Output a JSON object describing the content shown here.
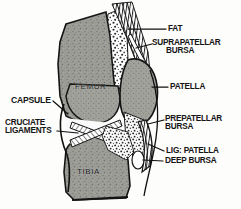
{
  "figure": {
    "background_color": "#fdfdfb",
    "ink_color": "#141414",
    "bone_fill_color": "#9a9a96",
    "stipple_fill_color": "#ffffff"
  },
  "internal_labels": {
    "femur": "FEMUR",
    "tibia": "TIBIA"
  },
  "callouts": {
    "fat": "FAT",
    "suprapatellar_bursa_line1": "SUPRAPATELLAR",
    "suprapatellar_bursa_line2": "BURSA",
    "patella": "PATELLA",
    "prepatellar_bursa_line1": "PREPATELLAR",
    "prepatellar_bursa_line2": "BURSA",
    "lig_patella": "LIG: PATELLA",
    "deep_bursa": "DEEP BURSA",
    "capsule": "CAPSULE",
    "cruciate_ligaments_line1": "CRUCIATE",
    "cruciate_ligaments_line2": "LIGAMENTS"
  },
  "structures": [
    {
      "name": "femur",
      "side": "internal",
      "texture": "stippled-grey"
    },
    {
      "name": "tibia",
      "side": "internal",
      "texture": "stippled-grey"
    },
    {
      "name": "patella",
      "side": "right",
      "texture": "stippled-grey"
    },
    {
      "name": "quadriceps-tendon",
      "side": "top",
      "texture": "parallel-lines"
    },
    {
      "name": "fat-pad",
      "side": "right",
      "texture": "coarse-stipple"
    },
    {
      "name": "suprapatellar-bursa",
      "side": "top-right",
      "texture": "line"
    },
    {
      "name": "prepatellar-bursa",
      "side": "right",
      "texture": "coarse-stipple"
    },
    {
      "name": "ligamentum-patellae",
      "side": "right-lower",
      "texture": "parallel-lines"
    },
    {
      "name": "deep-infrapatellar-bursa",
      "side": "right-lower",
      "texture": "void"
    },
    {
      "name": "cruciate-ligaments",
      "side": "centre",
      "texture": "crossed-hatch"
    },
    {
      "name": "joint-capsule",
      "side": "left",
      "texture": "outline"
    }
  ]
}
